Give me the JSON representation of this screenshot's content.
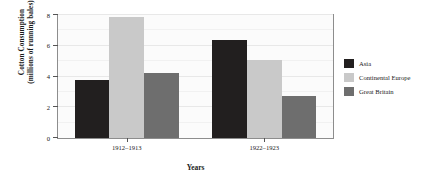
{
  "chart_data": {
    "type": "bar",
    "title": "",
    "subtitle": "",
    "xlabel": "Years",
    "ylabel": "Cotton Consumption (millions of running bales)",
    "ylabel_line1": "Cotton Consumption",
    "ylabel_line2": "(millions of running bales)",
    "categories": [
      "1912–1913",
      "1922–1923"
    ],
    "series": [
      {
        "name": "Asia",
        "values": [
          3.75,
          6.4
        ],
        "color": "#221f1f"
      },
      {
        "name": "Continental Europe",
        "values": [
          7.85,
          5.1
        ],
        "color": "#c9c9c9"
      },
      {
        "name": "Great Britain",
        "values": [
          4.25,
          2.75
        ],
        "color": "#6e6e6e"
      }
    ],
    "ylim": [
      0,
      8
    ],
    "yticks": [
      0,
      2,
      4,
      6,
      8
    ],
    "ytick_labels": [
      "0",
      "2",
      "4",
      "6",
      "8"
    ],
    "grid": true,
    "legend_position": "right",
    "legend_entries": [
      "Asia",
      "Continental Europe",
      "Great Britain"
    ],
    "annotations": []
  },
  "axes": {
    "y_title_line1": "Cotton Consumption",
    "y_title_line2": "(millions of running bales)",
    "x_title": "Years",
    "y_tick_0": "0",
    "y_tick_1": "2",
    "y_tick_2": "4",
    "y_tick_3": "6",
    "y_tick_4": "8",
    "x_tick_0": "1912–1913",
    "x_tick_1": "1922–1923"
  },
  "legend": {
    "item_0_label": "Asia",
    "item_1_label": "Continental Europe",
    "item_2_label": "Great Britain"
  },
  "colors": {
    "asia": "#221f1f",
    "continental_europe": "#c9c9c9",
    "great_britain": "#6e6e6e",
    "background": "#ffffff",
    "plot_background": "#fbfbfb",
    "axis": "#8d8d8d",
    "grid": "#e8e8e8",
    "text": "#1a1a1a"
  }
}
